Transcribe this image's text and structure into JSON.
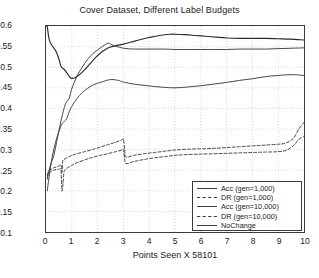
{
  "chart_data": {
    "type": "line",
    "title": "Cover Dataset, Different Label Budgets",
    "xlabel": "Points Seen X 58101",
    "ylabel": "",
    "xlim": [
      0,
      10
    ],
    "ylim": [
      0.1,
      0.6
    ],
    "xticks": [
      "0",
      "1",
      "2",
      "3",
      "4",
      "5",
      "6",
      "7",
      "8",
      "9",
      "10"
    ],
    "yticks": [
      "0.1",
      "0.15",
      "0.2",
      "0.25",
      "0.3",
      "0.35",
      "0.4",
      "0.45",
      "0.5",
      "0.55",
      "0.6"
    ],
    "grid": true,
    "legend_position": "lower right",
    "series": [
      {
        "name": "Acc (gen=1,000)",
        "style": "solid",
        "color": "#3c3c3c",
        "x": [
          0.05,
          0.1,
          0.2,
          0.3,
          0.45,
          0.6,
          0.75,
          0.9,
          1.0,
          1.2,
          1.4,
          1.6,
          1.8,
          2.0,
          2.2,
          2.4,
          2.5,
          2.7,
          3.0,
          3.4,
          3.8,
          4.2,
          4.6,
          5.0,
          5.5,
          6.0,
          6.5,
          7.0,
          7.5,
          8.0,
          8.5,
          9.0,
          9.5,
          10.0
        ],
        "y": [
          0.228,
          0.245,
          0.268,
          0.285,
          0.33,
          0.375,
          0.41,
          0.425,
          0.448,
          0.478,
          0.5,
          0.518,
          0.532,
          0.542,
          0.551,
          0.558,
          0.556,
          0.551,
          0.546,
          0.544,
          0.544,
          0.544,
          0.544,
          0.543,
          0.543,
          0.543,
          0.543,
          0.543,
          0.544,
          0.544,
          0.544,
          0.545,
          0.546,
          0.547
        ]
      },
      {
        "name": "DR (gen=1,000)",
        "style": "dashed",
        "color": "#3c3c3c",
        "x": [
          0.05,
          0.1,
          0.2,
          0.3,
          0.4,
          0.5,
          0.6,
          0.62,
          0.65,
          0.7,
          0.8,
          0.9,
          1.0,
          1.2,
          1.5,
          1.8,
          2.1,
          2.4,
          2.7,
          2.95,
          3.0,
          3.05,
          3.1,
          3.4,
          3.8,
          4.2,
          4.6,
          5.0,
          5.5,
          6.0,
          6.5,
          7.0,
          7.5,
          8.0,
          8.5,
          9.0,
          9.3,
          9.6,
          9.8,
          10.0
        ],
        "y": [
          0.238,
          0.248,
          0.252,
          0.256,
          0.258,
          0.26,
          0.262,
          0.245,
          0.272,
          0.276,
          0.28,
          0.283,
          0.286,
          0.29,
          0.295,
          0.3,
          0.306,
          0.312,
          0.318,
          0.324,
          0.325,
          0.3,
          0.282,
          0.286,
          0.29,
          0.293,
          0.296,
          0.299,
          0.301,
          0.302,
          0.303,
          0.305,
          0.307,
          0.309,
          0.311,
          0.313,
          0.316,
          0.328,
          0.35,
          0.366
        ]
      },
      {
        "name": "Acc (gen=10,000)",
        "style": "solid",
        "color": "#3c3c3c",
        "x": [
          0.05,
          0.1,
          0.2,
          0.3,
          0.45,
          0.6,
          0.7,
          0.8,
          0.9,
          1.0,
          1.2,
          1.4,
          1.6,
          1.8,
          2.0,
          2.2,
          2.4,
          2.6,
          2.8,
          3.0,
          3.4,
          3.8,
          4.2,
          4.6,
          5.0,
          5.5,
          6.0,
          6.5,
          7.0,
          7.5,
          8.0,
          8.5,
          9.0,
          9.5,
          10.0
        ],
        "y": [
          0.2,
          0.225,
          0.268,
          0.3,
          0.335,
          0.36,
          0.368,
          0.375,
          0.392,
          0.405,
          0.424,
          0.438,
          0.448,
          0.456,
          0.461,
          0.465,
          0.469,
          0.47,
          0.468,
          0.464,
          0.459,
          0.456,
          0.453,
          0.451,
          0.45,
          0.452,
          0.455,
          0.459,
          0.463,
          0.468,
          0.472,
          0.477,
          0.48,
          0.482,
          0.48
        ]
      },
      {
        "name": "DR (gen=10,000)",
        "style": "dashed",
        "color": "#3c3c3c",
        "x": [
          0.05,
          0.1,
          0.2,
          0.3,
          0.4,
          0.5,
          0.58,
          0.62,
          0.66,
          0.7,
          0.8,
          0.9,
          1.0,
          1.2,
          1.5,
          1.8,
          2.1,
          2.4,
          2.7,
          2.95,
          3.0,
          3.05,
          3.1,
          3.4,
          3.8,
          4.2,
          4.6,
          5.0,
          5.5,
          6.0,
          6.5,
          7.0,
          7.5,
          8.0,
          8.5,
          9.0,
          9.3,
          9.6,
          9.8,
          10.0
        ],
        "y": [
          0.232,
          0.242,
          0.247,
          0.25,
          0.252,
          0.252,
          0.25,
          0.2,
          0.218,
          0.246,
          0.254,
          0.258,
          0.262,
          0.268,
          0.275,
          0.281,
          0.286,
          0.29,
          0.295,
          0.299,
          0.3,
          0.278,
          0.266,
          0.271,
          0.276,
          0.28,
          0.283,
          0.286,
          0.288,
          0.289,
          0.29,
          0.291,
          0.292,
          0.293,
          0.294,
          0.295,
          0.298,
          0.31,
          0.325,
          0.332
        ]
      },
      {
        "name": "NoChange",
        "style": "solid",
        "color": "#2a2a2a",
        "x": [
          0.02,
          0.05,
          0.1,
          0.15,
          0.2,
          0.3,
          0.4,
          0.5,
          0.55,
          0.6,
          0.7,
          0.8,
          0.9,
          0.95,
          1.0,
          1.1,
          1.3,
          1.5,
          1.7,
          1.9,
          2.1,
          2.3,
          2.5,
          2.7,
          3.0,
          3.3,
          3.6,
          4.0,
          4.4,
          4.8,
          5.0,
          5.4,
          5.8,
          6.2,
          6.6,
          7.0,
          7.5,
          8.0,
          8.5,
          9.0,
          9.5,
          10.0
        ],
        "y": [
          0.6,
          0.598,
          0.575,
          0.562,
          0.556,
          0.547,
          0.537,
          0.52,
          0.508,
          0.5,
          0.495,
          0.487,
          0.478,
          0.474,
          0.473,
          0.474,
          0.482,
          0.494,
          0.508,
          0.522,
          0.534,
          0.543,
          0.549,
          0.552,
          0.556,
          0.561,
          0.566,
          0.572,
          0.577,
          0.58,
          0.58,
          0.579,
          0.577,
          0.575,
          0.573,
          0.571,
          0.57,
          0.57,
          0.57,
          0.569,
          0.568,
          0.566
        ]
      }
    ]
  },
  "legend": {
    "items": [
      {
        "label": "Acc (gen=1,000)",
        "style": "solid"
      },
      {
        "label": "DR (gen=1,000)",
        "style": "dashed"
      },
      {
        "label": "Acc (gen=10,000)",
        "style": "solid"
      },
      {
        "label": "DR (gen=10,000)",
        "style": "dashed"
      },
      {
        "label": "NoChange",
        "style": "solid"
      }
    ]
  },
  "colors": {
    "axis": "#3a3a3a",
    "grid": "#b5b5b5",
    "line": "#3c3c3c",
    "background": "#ffffff"
  }
}
